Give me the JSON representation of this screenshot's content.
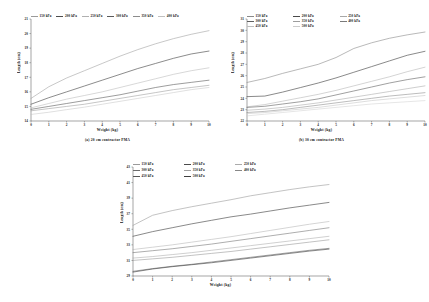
{
  "figure": {
    "xlabel": "Weight (kg)",
    "ylabel": "Length (cm)",
    "legend_suffix": "kPa"
  },
  "chart_data": [
    {
      "id": "a",
      "type": "line",
      "title": "",
      "caption": "(a)  20 cm contractor PMA",
      "xlabel": "Weight (kg)",
      "ylabel": "Length (cm)",
      "xlim": [
        0,
        10
      ],
      "ylim": [
        14,
        21
      ],
      "xticks": [
        0,
        1,
        2,
        3,
        4,
        5,
        6,
        7,
        8,
        9,
        10
      ],
      "yticks": [
        14,
        15,
        16,
        17,
        18,
        19,
        20,
        21
      ],
      "grid": false,
      "legend_position": "top",
      "legend_rows": 1,
      "x": [
        0,
        1,
        2,
        3,
        4,
        5,
        6,
        7,
        8,
        9,
        10
      ],
      "series": [
        {
          "name": "150 kPa",
          "color": "#9a9a9a",
          "width": 0.55,
          "values": [
            15.55,
            16.35,
            16.95,
            17.45,
            17.95,
            18.45,
            18.9,
            19.3,
            19.65,
            19.95,
            20.2
          ]
        },
        {
          "name": "200 kPa",
          "color": "#4d4d4d",
          "width": 0.65,
          "values": [
            15.15,
            15.6,
            16.0,
            16.4,
            16.8,
            17.2,
            17.6,
            17.95,
            18.3,
            18.6,
            18.8
          ]
        },
        {
          "name": "250 kPa",
          "color": "#b0b0b0",
          "width": 0.5,
          "values": [
            14.9,
            15.2,
            15.5,
            15.75,
            16.0,
            16.3,
            16.6,
            16.9,
            17.2,
            17.45,
            17.65
          ]
        },
        {
          "name": "300 kPa",
          "color": "#5a5a5a",
          "width": 0.6,
          "values": [
            14.8,
            15.0,
            15.2,
            15.4,
            15.6,
            15.8,
            16.05,
            16.3,
            16.5,
            16.65,
            16.8
          ]
        },
        {
          "name": "350 kPa",
          "color": "#8c8c8c",
          "width": 0.5,
          "values": [
            14.7,
            14.85,
            15.0,
            15.15,
            15.35,
            15.55,
            15.75,
            15.95,
            16.15,
            16.3,
            16.45
          ]
        },
        {
          "name": "400 kPa",
          "color": "#c0c0c0",
          "width": 0.5,
          "values": [
            14.45,
            14.6,
            14.78,
            14.95,
            15.15,
            15.35,
            15.55,
            15.75,
            15.95,
            16.15,
            16.3
          ]
        }
      ]
    },
    {
      "id": "b",
      "type": "line",
      "title": "",
      "caption": "(b) 30 cm contractor PMA",
      "xlabel": "Weight (kg)",
      "ylabel": "Length (cm)",
      "xlim": [
        0,
        10
      ],
      "ylim": [
        22,
        31
      ],
      "xticks": [
        0,
        1,
        2,
        3,
        4,
        5,
        6,
        7,
        8,
        9,
        10
      ],
      "yticks": [
        22,
        23,
        24,
        25,
        26,
        27,
        28,
        29,
        30,
        31
      ],
      "grid": false,
      "legend_position": "top",
      "legend_rows": 2,
      "x": [
        0,
        1,
        2,
        3,
        4,
        5,
        6,
        7,
        8,
        9,
        10
      ],
      "series": [
        {
          "name": "150 kPa",
          "color": "#8a8a8a",
          "width": 0.6,
          "values": [
            25.4,
            25.75,
            26.2,
            26.6,
            27.0,
            27.6,
            28.4,
            28.9,
            29.3,
            29.6,
            29.85
          ]
        },
        {
          "name": "200 kPa",
          "color": "#4a4a4a",
          "width": 0.65,
          "values": [
            24.15,
            24.2,
            24.55,
            24.95,
            25.35,
            25.8,
            26.3,
            26.8,
            27.3,
            27.8,
            28.15
          ]
        },
        {
          "name": "250 kPa",
          "color": "#a8a8a8",
          "width": 0.5,
          "values": [
            23.25,
            23.45,
            23.75,
            24.05,
            24.35,
            24.7,
            25.1,
            25.5,
            25.9,
            26.35,
            26.75
          ]
        },
        {
          "name": "300 kPa",
          "color": "#5f5f5f",
          "width": 0.6,
          "values": [
            23.2,
            23.3,
            23.5,
            23.7,
            23.95,
            24.3,
            24.65,
            25.0,
            25.35,
            25.65,
            25.9
          ]
        },
        {
          "name": "350 kPa",
          "color": "#9d9d9d",
          "width": 0.5,
          "values": [
            22.95,
            23.05,
            23.2,
            23.4,
            23.6,
            23.85,
            24.1,
            24.35,
            24.6,
            24.85,
            25.1
          ]
        },
        {
          "name": "400 kPa",
          "color": "#7a7a7a",
          "width": 0.5,
          "values": [
            22.75,
            22.85,
            23.0,
            23.2,
            23.4,
            23.6,
            23.8,
            24.0,
            24.2,
            24.35,
            24.5
          ]
        },
        {
          "name": "450 kPa",
          "color": "#bdbdbd",
          "width": 0.5,
          "values": [
            22.65,
            22.75,
            22.9,
            23.05,
            23.2,
            23.4,
            23.6,
            23.8,
            23.95,
            24.1,
            24.25
          ]
        },
        {
          "name": "500 kPa",
          "color": "#cccccc",
          "width": 0.5,
          "values": [
            22.45,
            22.6,
            22.75,
            22.9,
            23.05,
            23.2,
            23.35,
            23.5,
            23.6,
            23.7,
            23.8
          ]
        }
      ]
    },
    {
      "id": "c",
      "type": "line",
      "title": "",
      "caption": "",
      "xlabel": "Weight (kg)",
      "ylabel": "Length (cm)",
      "xlim": [
        0,
        10
      ],
      "ylim": [
        29,
        43
      ],
      "xticks": [
        0,
        1,
        2,
        3,
        4,
        5,
        6,
        7,
        8,
        9,
        10
      ],
      "yticks": [
        29,
        31,
        33,
        35,
        37,
        39,
        41,
        43
      ],
      "grid": false,
      "legend_position": "top",
      "legend_rows": 2,
      "x": [
        0,
        1,
        2,
        3,
        4,
        5,
        6,
        7,
        8,
        9,
        10
      ],
      "series": [
        {
          "name": "150 kPa",
          "color": "#9a9a9a",
          "width": 0.6,
          "values": [
            35.5,
            36.8,
            37.4,
            37.9,
            38.35,
            38.8,
            39.3,
            39.7,
            40.1,
            40.45,
            40.75
          ]
        },
        {
          "name": "200 kPa",
          "color": "#4a4a4a",
          "width": 0.65,
          "values": [
            34.1,
            34.7,
            35.2,
            35.7,
            36.15,
            36.6,
            36.95,
            37.35,
            37.75,
            38.1,
            38.45
          ]
        },
        {
          "name": "250 kPa",
          "color": "#ababab",
          "width": 0.5,
          "values": [
            32.4,
            32.7,
            33.0,
            33.35,
            33.7,
            34.05,
            34.45,
            34.85,
            35.25,
            35.65,
            36.0
          ]
        },
        {
          "name": "300 kPa",
          "color": "#6b6b6b",
          "width": 0.55,
          "values": [
            32.0,
            32.25,
            32.5,
            32.8,
            33.1,
            33.45,
            33.8,
            34.15,
            34.5,
            34.85,
            35.2
          ]
        },
        {
          "name": "350 kPa",
          "color": "#a0a0a0",
          "width": 0.5,
          "values": [
            31.3,
            31.5,
            31.75,
            32.0,
            32.3,
            32.6,
            32.9,
            33.2,
            33.5,
            33.8,
            34.1
          ]
        },
        {
          "name": "400 kPa",
          "color": "#878787",
          "width": 0.5,
          "values": [
            31.0,
            31.2,
            31.4,
            31.65,
            31.9,
            32.15,
            32.45,
            32.75,
            33.05,
            33.35,
            33.65
          ]
        },
        {
          "name": "450 kPa",
          "color": "#555555",
          "width": 0.55,
          "values": [
            29.6,
            29.95,
            30.25,
            30.5,
            30.8,
            31.1,
            31.4,
            31.7,
            32.0,
            32.3,
            32.55
          ]
        },
        {
          "name": "500 kPa",
          "color": "#3f3f3f",
          "width": 0.6,
          "values": [
            29.5,
            29.9,
            30.2,
            30.45,
            30.7,
            31.0,
            31.3,
            31.6,
            31.9,
            32.2,
            32.45
          ]
        }
      ]
    }
  ]
}
